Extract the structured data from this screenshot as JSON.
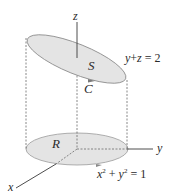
{
  "diagram": {
    "type": "3d-surface-illustration",
    "axes": {
      "x_label": "x",
      "y_label": "y",
      "z_label": "z"
    },
    "regions": {
      "top_surface_label": "S",
      "boundary_curve_label": "C",
      "base_region_label": "R"
    },
    "equations": {
      "plane": {
        "lhs_var1": "y",
        "plus": "+",
        "lhs_var2": "z",
        "equals": "=",
        "rhs": "2"
      },
      "cylinder": {
        "var1": "x",
        "exp1": "2",
        "plus": "+",
        "var2": "y",
        "exp2": "2",
        "equals": "=",
        "rhs": "1"
      }
    },
    "colors": {
      "surface_fill": "#e4e4e4",
      "outline": "#8a8a8a",
      "axis": "#3a3a3a",
      "dashed": "#6a6a6a",
      "text": "#2a2a2a"
    }
  }
}
